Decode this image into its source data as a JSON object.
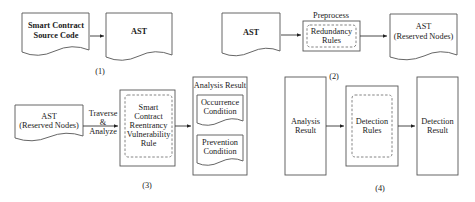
{
  "panels": [
    {
      "id": "1",
      "label": "(1)",
      "nodes": [
        {
          "type": "document",
          "lines": [
            "Smart Contract",
            "Source Code"
          ]
        },
        {
          "type": "document",
          "lines": [
            "AST"
          ]
        }
      ]
    },
    {
      "id": "2",
      "label": "(2)",
      "process_label": "Preprocess",
      "nodes": [
        {
          "type": "document",
          "lines": [
            "AST"
          ]
        },
        {
          "type": "process",
          "lines": [
            "Redundancy",
            "Rules"
          ]
        },
        {
          "type": "document",
          "lines": [
            "AST",
            "(Reserved Nodes)"
          ]
        }
      ]
    },
    {
      "id": "3",
      "label": "(3)",
      "edge_label": [
        "Traverse",
        "&",
        "Analyze"
      ],
      "nodes": [
        {
          "type": "document",
          "lines": [
            "AST",
            "(Reserved Nodes)"
          ]
        },
        {
          "type": "process",
          "lines": [
            "Smart",
            "Contract",
            "Reentrancy",
            "Vulnerability",
            "Rule"
          ]
        },
        {
          "type": "container",
          "title": "Analysis Result",
          "children": [
            {
              "type": "document",
              "lines": [
                "Occurrence",
                "Condition"
              ]
            },
            {
              "type": "document",
              "lines": [
                "Prevention",
                "Condition"
              ]
            }
          ]
        }
      ]
    },
    {
      "id": "4",
      "label": "(4)",
      "nodes": [
        {
          "type": "box",
          "lines": [
            "Analysis",
            "Result"
          ]
        },
        {
          "type": "process",
          "lines": [
            "Detection",
            "Rules"
          ]
        },
        {
          "type": "box",
          "lines": [
            "Detection",
            "Result"
          ]
        }
      ]
    }
  ],
  "colors": {
    "stroke": "#555555",
    "dashed": "#777777",
    "text": "#1a1a1a",
    "background": "#ffffff"
  }
}
